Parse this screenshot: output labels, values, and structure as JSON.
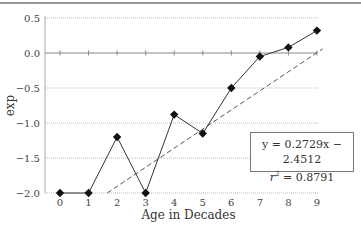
{
  "chart_data": {
    "type": "line",
    "title": "",
    "xlabel": "Age in Decades",
    "ylabel": "exp",
    "x": [
      0,
      1,
      2,
      3,
      4,
      5,
      6,
      7,
      8,
      9
    ],
    "series": [
      {
        "name": "exp",
        "values": [
          -2.0,
          -2.0,
          -1.2,
          -2.0,
          -0.88,
          -1.15,
          -0.5,
          -0.05,
          0.08,
          0.32
        ],
        "style": "solid-line-diamond-markers"
      },
      {
        "name": "Linear trend",
        "style": "dashed",
        "slope": 0.2729,
        "intercept": -2.4512
      }
    ],
    "xticks": [
      "0",
      "1",
      "2",
      "3",
      "4",
      "5",
      "6",
      "7",
      "8",
      "9"
    ],
    "yticks": [
      "0.5",
      "0.0",
      "−0.5",
      "−1.0",
      "−1.5",
      "−2.0"
    ],
    "ylim": [
      -2.0,
      0.5
    ],
    "xlim": [
      0,
      9
    ],
    "grid": "horizontal dotted",
    "annotations": {
      "equation": "y = 0.2729x − 2.4512",
      "r2_label": "r",
      "r2_value": " = 0.8791"
    }
  }
}
